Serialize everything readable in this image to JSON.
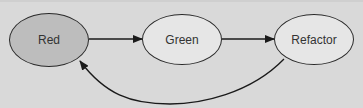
{
  "diagram": {
    "type": "cycle",
    "nodes": [
      {
        "id": "red",
        "label": "Red",
        "fill": "#bdbdbd"
      },
      {
        "id": "green",
        "label": "Green",
        "fill": "#e6e6e6"
      },
      {
        "id": "refactor",
        "label": "Refactor",
        "fill": "#e6e6e6"
      }
    ],
    "edges": [
      {
        "from": "red",
        "to": "green"
      },
      {
        "from": "green",
        "to": "refactor"
      },
      {
        "from": "refactor",
        "to": "red",
        "style": "curved-return"
      }
    ],
    "colors": {
      "background": "#d9d9d9",
      "stroke": "#2a2a2a",
      "text": "#333333"
    }
  }
}
